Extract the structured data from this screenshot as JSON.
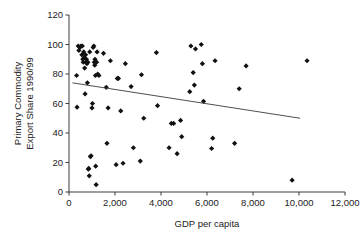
{
  "chart_data": {
    "type": "scatter",
    "title": "",
    "xlabel": "GDP per capita",
    "ylabel": "Primary Commodity Export Share 1990/99",
    "ylabel_line1": "Primary Commodity",
    "ylabel_line2": "Export Share 1990/99",
    "xlim": [
      0,
      12000
    ],
    "ylim": [
      0,
      120
    ],
    "xticks": [
      0,
      2000,
      4000,
      6000,
      8000,
      10000,
      12000
    ],
    "xtick_labels": [
      "0",
      "2,000",
      "4,000",
      "6,000",
      "8,000",
      "10,000",
      "12,000"
    ],
    "yticks": [
      0,
      20,
      40,
      60,
      80,
      100,
      120
    ],
    "ytick_labels": [
      "0",
      "20",
      "40",
      "60",
      "80",
      "100",
      "120"
    ],
    "grid": false,
    "legend": null,
    "marker": "diamond",
    "marker_color": "#111111",
    "points": [
      [
        330,
        79
      ],
      [
        350,
        57.5
      ],
      [
        400,
        99
      ],
      [
        430,
        96
      ],
      [
        470,
        98
      ],
      [
        520,
        99
      ],
      [
        560,
        93
      ],
      [
        580,
        99
      ],
      [
        600,
        90
      ],
      [
        620,
        88
      ],
      [
        640,
        95
      ],
      [
        660,
        91
      ],
      [
        680,
        84
      ],
      [
        700,
        66.5
      ],
      [
        720,
        93
      ],
      [
        740,
        88
      ],
      [
        760,
        90
      ],
      [
        780,
        87
      ],
      [
        800,
        74
      ],
      [
        820,
        88
      ],
      [
        840,
        15.5
      ],
      [
        860,
        16
      ],
      [
        880,
        11
      ],
      [
        900,
        95
      ],
      [
        930,
        24
      ],
      [
        960,
        24.5
      ],
      [
        1000,
        57
      ],
      [
        1020,
        60
      ],
      [
        1050,
        98
      ],
      [
        1080,
        99
      ],
      [
        1100,
        88
      ],
      [
        1120,
        86
      ],
      [
        1130,
        90
      ],
      [
        1150,
        79
      ],
      [
        1160,
        17.5
      ],
      [
        1180,
        5
      ],
      [
        1200,
        88
      ],
      [
        1220,
        95
      ],
      [
        1250,
        80
      ],
      [
        1300,
        79
      ],
      [
        1500,
        94
      ],
      [
        1620,
        71
      ],
      [
        1650,
        33
      ],
      [
        1700,
        57
      ],
      [
        1800,
        89
      ],
      [
        2050,
        18.5
      ],
      [
        2100,
        77
      ],
      [
        2150,
        77
      ],
      [
        2250,
        55
      ],
      [
        2350,
        19.5
      ],
      [
        2450,
        87
      ],
      [
        2700,
        71.5
      ],
      [
        2800,
        30
      ],
      [
        3100,
        21
      ],
      [
        3150,
        79.5
      ],
      [
        3250,
        50
      ],
      [
        3800,
        94.5
      ],
      [
        3850,
        58.5
      ],
      [
        4350,
        30
      ],
      [
        4450,
        46.5
      ],
      [
        4550,
        46.5
      ],
      [
        4700,
        26
      ],
      [
        4850,
        48.5
      ],
      [
        4900,
        37.5
      ],
      [
        5250,
        68
      ],
      [
        5300,
        99
      ],
      [
        5400,
        81
      ],
      [
        5450,
        72.5
      ],
      [
        5500,
        97
      ],
      [
        5750,
        100
      ],
      [
        5800,
        87
      ],
      [
        5850,
        61.5
      ],
      [
        6200,
        29.5
      ],
      [
        6250,
        36.5
      ],
      [
        6350,
        89
      ],
      [
        7200,
        33
      ],
      [
        7400,
        70
      ],
      [
        7700,
        85.5
      ],
      [
        9700,
        8
      ],
      [
        10350,
        89
      ]
    ],
    "trend_line": {
      "x_start": 150,
      "y_start": 74,
      "x_end": 10050,
      "y_end": 50
    }
  }
}
